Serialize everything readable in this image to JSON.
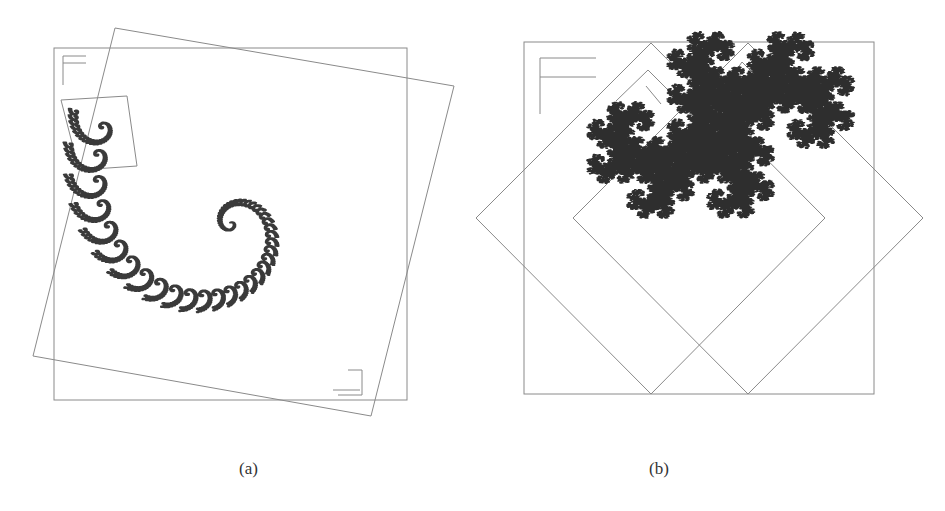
{
  "figure": {
    "panels": [
      {
        "id": "a",
        "caption": "(a)",
        "description": "Spiral IFS fractal: outer square frame with large rotated square map and small rotated square map; F-shaped orientation markers",
        "fractal_color": "#3a3a3a",
        "frame_color": "#8a8a8a"
      },
      {
        "id": "b",
        "caption": "(b)",
        "description": "Twin-dragon style IFS fractal: outer square frame with two 45-degree rotated square maps; F-shaped orientation markers",
        "fractal_color": "#2e2e2e",
        "frame_color": "#9a9a9a"
      }
    ]
  }
}
